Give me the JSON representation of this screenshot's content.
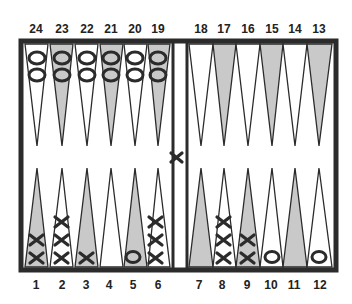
{
  "board": {
    "title": "Backgammon board position",
    "colors": {
      "frame": "#2b2b2b",
      "light_point": "#ffffff",
      "dark_point": "#c9c9c9",
      "background": "#ffffff"
    },
    "top_labels": [
      "24",
      "23",
      "22",
      "21",
      "20",
      "19",
      "18",
      "17",
      "16",
      "15",
      "14",
      "13"
    ],
    "bottom_labels": [
      "1",
      "2",
      "3",
      "4",
      "5",
      "6",
      "7",
      "8",
      "9",
      "10",
      "11",
      "12"
    ]
  },
  "points": [
    {
      "point": 1,
      "checkers": {
        "player": "X",
        "count": 2
      }
    },
    {
      "point": 2,
      "checkers": {
        "player": "X",
        "count": 3
      }
    },
    {
      "point": 3,
      "checkers": {
        "player": "X",
        "count": 1
      }
    },
    {
      "point": 4,
      "checkers": {
        "player": "",
        "count": 0
      }
    },
    {
      "point": 5,
      "checkers": {
        "player": "O",
        "count": 1
      }
    },
    {
      "point": 6,
      "checkers": {
        "player": "X",
        "count": 3
      }
    },
    {
      "point": 7,
      "checkers": {
        "player": "",
        "count": 0
      }
    },
    {
      "point": 8,
      "checkers": {
        "player": "X",
        "count": 3
      }
    },
    {
      "point": 9,
      "checkers": {
        "player": "X",
        "count": 2
      }
    },
    {
      "point": 10,
      "checkers": {
        "player": "O",
        "count": 1
      }
    },
    {
      "point": 11,
      "checkers": {
        "player": "",
        "count": 0
      }
    },
    {
      "point": 12,
      "checkers": {
        "player": "O",
        "count": 1
      }
    },
    {
      "point": 13,
      "checkers": {
        "player": "",
        "count": 0
      }
    },
    {
      "point": 14,
      "checkers": {
        "player": "",
        "count": 0
      }
    },
    {
      "point": 15,
      "checkers": {
        "player": "",
        "count": 0
      }
    },
    {
      "point": 16,
      "checkers": {
        "player": "",
        "count": 0
      }
    },
    {
      "point": 17,
      "checkers": {
        "player": "",
        "count": 0
      }
    },
    {
      "point": 18,
      "checkers": {
        "player": "",
        "count": 0
      }
    },
    {
      "point": 19,
      "checkers": {
        "player": "O",
        "count": 2
      }
    },
    {
      "point": 20,
      "checkers": {
        "player": "O",
        "count": 2
      }
    },
    {
      "point": 21,
      "checkers": {
        "player": "O",
        "count": 2
      }
    },
    {
      "point": 22,
      "checkers": {
        "player": "O",
        "count": 2
      }
    },
    {
      "point": 23,
      "checkers": {
        "player": "O",
        "count": 2
      }
    },
    {
      "point": 24,
      "checkers": {
        "player": "O",
        "count": 2
      }
    }
  ],
  "bar": {
    "checkers": [
      {
        "player": "X",
        "count": 1
      }
    ]
  }
}
